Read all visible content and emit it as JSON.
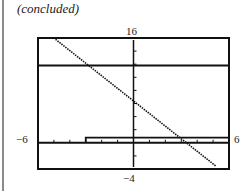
{
  "caption": "(concluded)",
  "chart_data": {
    "type": "line",
    "title": "",
    "xlabel": "",
    "ylabel": "",
    "xlim": [
      -6,
      6
    ],
    "ylim": [
      -4,
      16
    ],
    "window_labels": {
      "ymax": "16",
      "ymin": "-4",
      "xmin": "-6",
      "xmax": "6"
    },
    "x_tick_step": 1,
    "y_tick_step": 2,
    "grid": false,
    "series": [
      {
        "name": "decreasing line",
        "style": "dotted",
        "x": [
          -4.9,
          5.2
        ],
        "y": [
          15.8,
          -3.6
        ]
      },
      {
        "name": "horizontal line",
        "style": "solid",
        "x": [
          -6,
          6
        ],
        "y": [
          11.8,
          11.8
        ]
      },
      {
        "name": "step function",
        "style": "solid",
        "x": [
          -3,
          -3,
          6
        ],
        "y": [
          0,
          0.8,
          0.8
        ]
      }
    ]
  },
  "labels": {
    "top": "16",
    "bottom": "−4",
    "left": "−6",
    "right": "6"
  }
}
